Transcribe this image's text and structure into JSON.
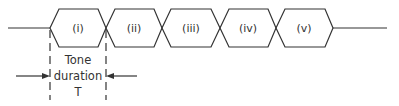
{
  "diagram": {
    "type": "tone-sequence-timing",
    "tones": [
      {
        "label": "(i)"
      },
      {
        "label": "(ii)"
      },
      {
        "label": "(iii)"
      },
      {
        "label": "(iv)"
      },
      {
        "label": "(v)"
      }
    ],
    "annotation": {
      "line1": "Tone",
      "line2": "duration",
      "line3": "T"
    },
    "colors": {
      "stroke": "#333333",
      "background": "#ffffff"
    }
  }
}
